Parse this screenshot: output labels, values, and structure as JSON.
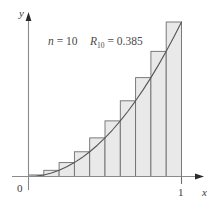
{
  "figure": {
    "background_color": "#ffffff",
    "annotation": {
      "n_var": "n",
      "n_eq": " = ",
      "n_value": "10",
      "r_var": "R",
      "r_subscript": "10",
      "r_eq": " = ",
      "r_value": "0.385",
      "full_text": "n = 10    R10 = 0.385"
    },
    "axes": {
      "y_label": "y",
      "x_label": "x",
      "origin_label": "0",
      "x_tick_label": "1",
      "axis_color": "#8a8a8a",
      "arrow_color": "#2b2b2b"
    },
    "style": {
      "bar_fill": "#e9e9e9",
      "bar_stroke": "#6e6e6e",
      "curve_color": "#555555",
      "text_color": "#3a3a3a"
    }
  },
  "chart_data": {
    "type": "bar",
    "title": "",
    "subtitle": "",
    "xlabel": "x",
    "ylabel": "y",
    "xlim": [
      0,
      1
    ],
    "ylim": [
      0,
      1
    ],
    "grid": false,
    "legend": false,
    "annotations": [
      "n = 10",
      "R10 = 0.385"
    ],
    "function": "y = x^2",
    "method": "right-endpoint Riemann sum",
    "n_rectangles": 10,
    "riemann_sum": 0.385,
    "x_tick_values": [
      0,
      1
    ],
    "x_tick_labels": [
      "0",
      "1"
    ],
    "y_tick_values": [],
    "y_tick_labels": [],
    "categories": [
      "0.0-0.1",
      "0.1-0.2",
      "0.2-0.3",
      "0.3-0.4",
      "0.4-0.5",
      "0.5-0.6",
      "0.6-0.7",
      "0.7-0.8",
      "0.8-0.9",
      "0.9-1.0"
    ],
    "bar_left_edges": [
      0.0,
      0.1,
      0.2,
      0.3,
      0.4,
      0.5,
      0.6,
      0.7,
      0.8,
      0.9
    ],
    "bar_right_edges": [
      0.1,
      0.2,
      0.3,
      0.4,
      0.5,
      0.6,
      0.7,
      0.8,
      0.9,
      1.0
    ],
    "values": [
      0.01,
      0.04,
      0.09,
      0.16,
      0.25,
      0.36,
      0.49,
      0.64,
      0.81,
      1.0
    ],
    "series": [
      {
        "name": "right-endpoint rectangles",
        "values": [
          0.01,
          0.04,
          0.09,
          0.16,
          0.25,
          0.36,
          0.49,
          0.64,
          0.81,
          1.0
        ]
      },
      {
        "name": "y = x^2 curve",
        "x": [
          0.0,
          0.05,
          0.1,
          0.15,
          0.2,
          0.25,
          0.3,
          0.35,
          0.4,
          0.45,
          0.5,
          0.55,
          0.6,
          0.65,
          0.7,
          0.75,
          0.8,
          0.85,
          0.9,
          0.95,
          1.0
        ],
        "values": [
          0.0,
          0.0025,
          0.01,
          0.0225,
          0.04,
          0.0625,
          0.09,
          0.1225,
          0.16,
          0.2025,
          0.25,
          0.3025,
          0.36,
          0.4225,
          0.49,
          0.5625,
          0.64,
          0.7225,
          0.81,
          0.9025,
          1.0
        ]
      }
    ]
  }
}
